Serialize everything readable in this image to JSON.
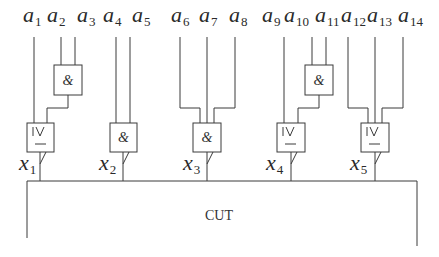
{
  "diagram": {
    "inputs": [
      {
        "base": "a",
        "sub": "1"
      },
      {
        "base": "a",
        "sub": "2"
      },
      {
        "base": "a",
        "sub": "3"
      },
      {
        "base": "a",
        "sub": "4"
      },
      {
        "base": "a",
        "sub": "5"
      },
      {
        "base": "a",
        "sub": "6"
      },
      {
        "base": "a",
        "sub": "7"
      },
      {
        "base": "a",
        "sub": "8"
      },
      {
        "base": "a",
        "sub": "9"
      },
      {
        "base": "a",
        "sub": "10"
      },
      {
        "base": "a",
        "sub": "11"
      },
      {
        "base": "a",
        "sub": "12"
      },
      {
        "base": "a",
        "sub": "13"
      },
      {
        "base": "a",
        "sub": "14"
      }
    ],
    "upper_gates": [
      {
        "type": "AND",
        "symbol": "&",
        "inputs": [
          "a2",
          "a3"
        ]
      },
      {
        "type": "AND",
        "symbol": "&",
        "inputs": [
          "a10",
          "a11"
        ]
      }
    ],
    "lower_gates": [
      {
        "type": "THRESHOLD",
        "symbol_top": "|∨",
        "symbol_bottom": "—",
        "output": {
          "base": "x",
          "sub": "1"
        }
      },
      {
        "type": "AND",
        "symbol": "&",
        "output": {
          "base": "x",
          "sub": "2"
        }
      },
      {
        "type": "AND",
        "symbol": "&",
        "output": {
          "base": "x",
          "sub": "3"
        }
      },
      {
        "type": "THRESHOLD",
        "symbol_top": "|∨",
        "symbol_bottom": "—",
        "output": {
          "base": "x",
          "sub": "4"
        }
      },
      {
        "type": "THRESHOLD",
        "symbol_top": "|∨",
        "symbol_bottom": "—",
        "output": {
          "base": "x",
          "sub": "5"
        }
      }
    ],
    "cut_label": "CUT"
  }
}
